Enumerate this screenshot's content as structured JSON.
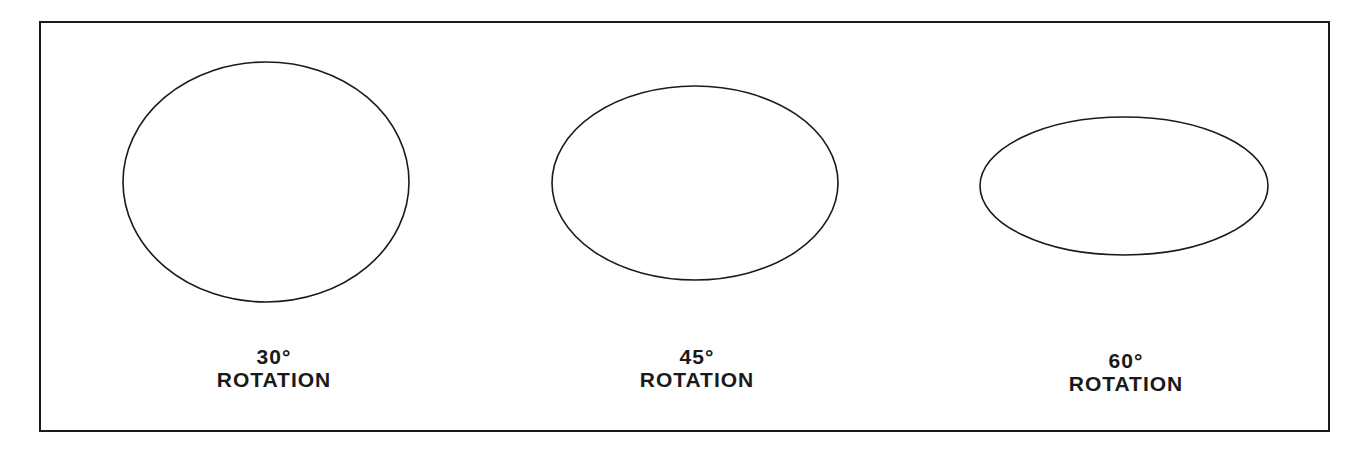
{
  "diagram": {
    "stroke_color": "#1a1a1a",
    "background": "#ffffff",
    "items": [
      {
        "angle": "30°",
        "caption": "ROTATION",
        "cx": 266,
        "cy": 182,
        "rx": 143,
        "ry": 120
      },
      {
        "angle": "45°",
        "caption": "ROTATION",
        "cx": 695,
        "cy": 183,
        "rx": 143,
        "ry": 97
      },
      {
        "angle": "60°",
        "caption": "ROTATION",
        "cx": 1124,
        "cy": 186,
        "rx": 144,
        "ry": 69
      }
    ]
  }
}
